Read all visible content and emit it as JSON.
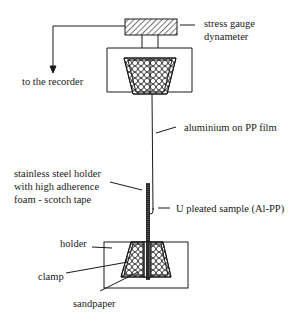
{
  "diagram": {
    "colors": {
      "line": "#1a1a1a",
      "background": "#ffffff"
    },
    "labels": {
      "gauge_line1": "stress gauge",
      "gauge_line2": "dynameter",
      "recorder": "to the recorder",
      "film": "aluminium on PP film",
      "steel_line1": "stainless steel holder",
      "steel_line2": "with high adherence",
      "steel_line3": "foam - scotch tape",
      "sample": "U pleated sample (Al-PP)",
      "holder": "holder",
      "clamp": "clamp",
      "sandpaper": "sandpaper"
    },
    "components": [
      {
        "id": "stress-gauge",
        "shape": "hatched-rectangle"
      },
      {
        "id": "upper-holder",
        "shape": "open-rectangle"
      },
      {
        "id": "upper-clamp",
        "shape": "crosshatched-trapezoid"
      },
      {
        "id": "film",
        "shape": "line"
      },
      {
        "id": "steel-holder",
        "shape": "dark-bar"
      },
      {
        "id": "u-pleat",
        "shape": "u-curve"
      },
      {
        "id": "lower-holder",
        "shape": "open-rectangle"
      },
      {
        "id": "lower-clamp",
        "shape": "crosshatched-trapezoid"
      },
      {
        "id": "recorder-arrow",
        "shape": "arrow"
      }
    ]
  }
}
